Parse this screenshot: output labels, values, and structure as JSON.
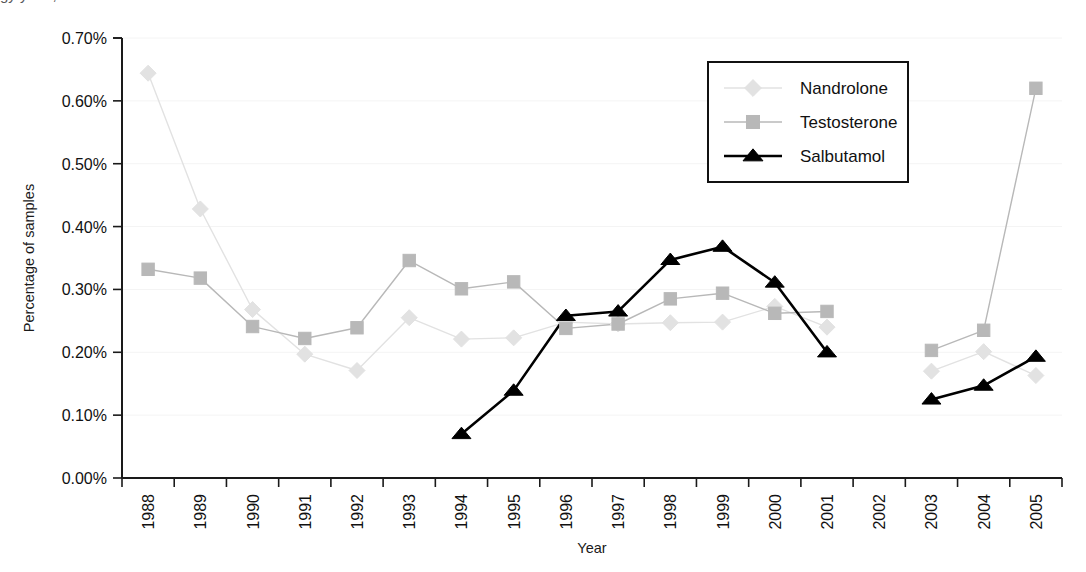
{
  "figure": {
    "top_cropped_artifact": "gy                             y  o  t                              ,"
  },
  "axes": {
    "y_title": "Percentage of samples",
    "x_title": "Year",
    "y_ticks": [
      "0.00%",
      "0.10%",
      "0.20%",
      "0.30%",
      "0.40%",
      "0.50%",
      "0.60%",
      "0.70%"
    ],
    "x_ticks": [
      "1988",
      "1989",
      "1990",
      "1991",
      "1992",
      "1993",
      "1994",
      "1995",
      "1996",
      "1997",
      "1998",
      "1999",
      "2000",
      "2001",
      "2002",
      "2003",
      "2004",
      "2005"
    ]
  },
  "legend": {
    "position": "top-right",
    "entries": [
      {
        "label": "Nandrolone",
        "marker": "diamond-marker",
        "color": "#e2e2e2"
      },
      {
        "label": "Testosterone",
        "marker": "square-marker",
        "color": "#b8b8b8"
      },
      {
        "label": "Salbutamol",
        "marker": "triangle-marker",
        "color": "#000000"
      }
    ]
  },
  "chart_data": {
    "type": "line",
    "title": "",
    "subtitle": "",
    "xlabel": "Year",
    "ylabel": "Percentage of samples",
    "x": [
      "1988",
      "1989",
      "1990",
      "1991",
      "1992",
      "1993",
      "1994",
      "1995",
      "1996",
      "1997",
      "1998",
      "1999",
      "2000",
      "2001",
      "2002",
      "2003",
      "2004",
      "2005"
    ],
    "ylim": [
      0.0,
      0.7
    ],
    "ytick_values": [
      0.0,
      0.1,
      0.2,
      0.3,
      0.4,
      0.5,
      0.6,
      0.7
    ],
    "yunit": "%",
    "grid": false,
    "legend_position": "top-right",
    "series": [
      {
        "name": "Nandrolone",
        "color": "#e2e2e2",
        "marker": "diamond",
        "values": [
          0.644,
          0.428,
          0.268,
          0.197,
          0.171,
          0.255,
          0.221,
          0.223,
          0.248,
          0.245,
          0.247,
          0.248,
          0.273,
          0.24,
          null,
          0.17,
          0.201,
          0.163
        ]
      },
      {
        "name": "Testosterone",
        "color": "#b8b8b8",
        "marker": "square",
        "values": [
          0.332,
          0.318,
          0.241,
          0.222,
          0.239,
          0.346,
          0.301,
          0.312,
          0.238,
          0.245,
          0.285,
          0.294,
          0.262,
          0.265,
          null,
          0.203,
          0.235,
          0.62
        ]
      },
      {
        "name": "Salbutamol",
        "color": "#000000",
        "marker": "triangle",
        "values": [
          null,
          null,
          null,
          null,
          null,
          null,
          0.07,
          0.139,
          0.258,
          0.265,
          0.347,
          0.368,
          0.311,
          0.2,
          null,
          0.125,
          0.147,
          0.193
        ]
      }
    ]
  }
}
